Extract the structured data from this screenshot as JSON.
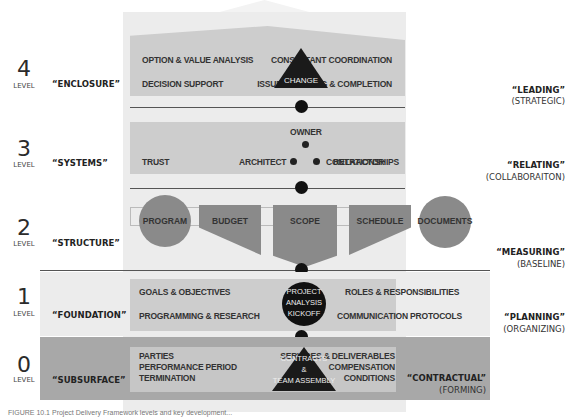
{
  "levels": [
    {
      "number": "4",
      "level_label": "LEVEL",
      "stage": "“ENCLOSURE”",
      "role": "“LEADING”",
      "role_sub": "(STRATEGIC)",
      "left_items": [
        "OPTION & VALUE ANALYSIS",
        "DECISION SUPPORT"
      ],
      "right_items": [
        "CONSULTANT COORDINATION",
        "ISSUE TRACKING & COMPLETION"
      ],
      "center": "CHANGE"
    },
    {
      "number": "3",
      "level_label": "LEVEL",
      "stage": "“SYSTEMS”",
      "role": "“RELATING”",
      "role_sub": "(COLLABORAITON)",
      "left_items": [
        "TRUST"
      ],
      "right_items": [
        "RELATIONSHIPS"
      ],
      "nodes": {
        "top": "OWNER",
        "left": "ARCHITECT",
        "right": "CONTRACTOR"
      }
    },
    {
      "number": "2",
      "level_label": "LEVEL",
      "stage": "“STRUCTURE”",
      "role": "“MEASURING”",
      "role_sub": "(BASELINE)",
      "shapes": [
        "PROGRAM",
        "BUDGET",
        "SCOPE",
        "SCHEDULE",
        "DOCUMENTS"
      ]
    },
    {
      "number": "1",
      "level_label": "LEVEL",
      "stage": "“FOUNDATION”",
      "role": "“PLANNING”",
      "role_sub": "(ORGANIZING)",
      "left_items": [
        "GOALS & OBJECTIVES",
        "PROGRAMMING & RESEARCH"
      ],
      "right_items": [
        "ROLES & RESPONSIBILITIES",
        "COMMUNICATION PROTOCOLS"
      ],
      "center": [
        "PROJECT",
        "ANALYSIS",
        "KICKOFF"
      ]
    },
    {
      "number": "0",
      "level_label": "LEVEL",
      "stage": "“SUBSURFACE”",
      "role": "“CONTRACTUAL”",
      "role_sub": "(FORMING)",
      "left_items": [
        "PARTIES",
        "PERFORMANCE PERIOD",
        "TERMINATION"
      ],
      "right_items": [
        "SERVICES & DELIVERABLES",
        "COMPENSATION",
        "CONDITIONS"
      ],
      "center": [
        "CONTRACTS",
        "&",
        "TEAM ASSEMBLY"
      ]
    }
  ],
  "caption": "FIGURE 10.1  Project Delivery Framework levels and key development..."
}
